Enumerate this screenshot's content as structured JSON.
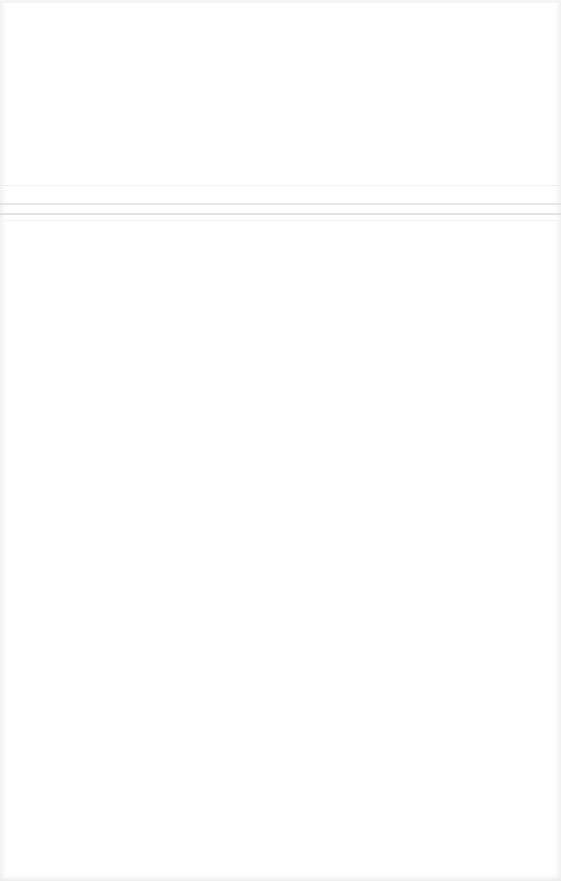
{
  "page": {
    "background": "#ffffff",
    "rules": [
      {
        "y": 185,
        "color": "#f0f0f0"
      },
      {
        "y": 203,
        "color": "#e6e6e6"
      },
      {
        "y": 213,
        "color": "#e2e2e2"
      },
      {
        "y": 220,
        "color": "#f2f2f2"
      }
    ]
  }
}
